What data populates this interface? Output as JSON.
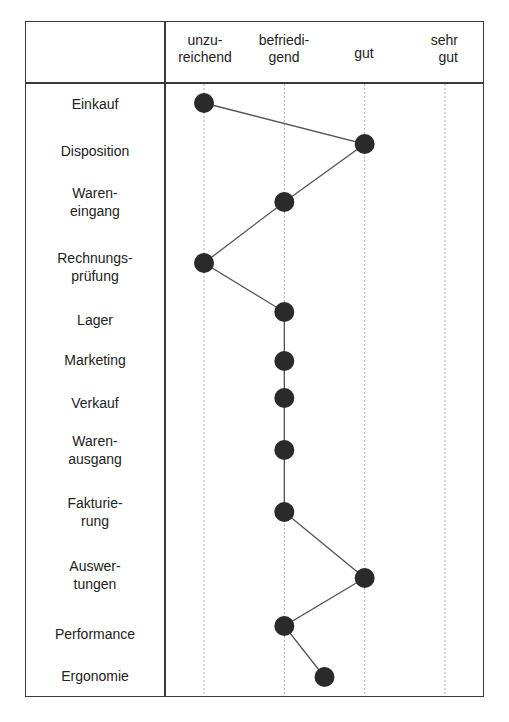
{
  "chart_data": {
    "type": "line",
    "orientation": "horizontal-profile",
    "title": "",
    "xlabel": "",
    "ylabel": "",
    "scale_labels": [
      "unzu-\nreichend",
      "befriedi-\ngend",
      "gut",
      "sehr\ngut"
    ],
    "scale_values": [
      1,
      2,
      3,
      4
    ],
    "xlim": [
      1,
      4
    ],
    "grid": "vertical dotted",
    "legend": "none",
    "categories": [
      "Einkauf",
      "Disposition",
      "Wareneingang",
      "Rechnungsprüfung",
      "Lager",
      "Marketing",
      "Verkauf",
      "Warenausgang",
      "Fakturierung",
      "Auswertungen",
      "Performance",
      "Ergonomie"
    ],
    "values": [
      1,
      3,
      2,
      1,
      2,
      2,
      2,
      2,
      2,
      3,
      2,
      2.5
    ],
    "colors": {
      "marker": "#2a2a2a",
      "line": "#555555",
      "grid": "#b0b0b0",
      "border": "#3a3a3a"
    }
  },
  "header": {
    "scale": [
      {
        "line1": "unzu-",
        "line2": "reichend"
      },
      {
        "line1": "befriedi-",
        "line2": "gend"
      },
      {
        "line1": "gut",
        "line2": ""
      },
      {
        "line1": "sehr",
        "line2": "gut"
      }
    ]
  },
  "rows": [
    {
      "line1": "Einkauf",
      "line2": ""
    },
    {
      "line1": "Disposition",
      "line2": ""
    },
    {
      "line1": "Waren-",
      "line2": "eingang"
    },
    {
      "line1": "Rechnungs-",
      "line2": "prüfung"
    },
    {
      "line1": "Lager",
      "line2": ""
    },
    {
      "line1": "Marketing",
      "line2": ""
    },
    {
      "line1": "Verkauf",
      "line2": ""
    },
    {
      "line1": "Waren-",
      "line2": "ausgang"
    },
    {
      "line1": "Fakturie-",
      "line2": "rung"
    },
    {
      "line1": "Auswer-",
      "line2": "tungen"
    },
    {
      "line1": "Performance",
      "line2": ""
    },
    {
      "line1": "Ergonomie",
      "line2": ""
    }
  ]
}
